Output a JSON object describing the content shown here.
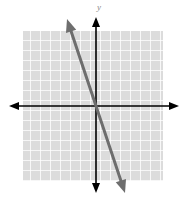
{
  "figure": {
    "title": "",
    "y_axis_label": "y",
    "x_axis_label": "",
    "background_color": "#ffffff"
  },
  "grid": {
    "background_color": "#dcdcdc",
    "line_color": "#ffffff",
    "cell_size_px": 10,
    "left_px": 23,
    "top_px": 31,
    "width_px": 140,
    "height_px": 150,
    "columns": 14,
    "rows": 15
  },
  "axes": {
    "color": "#000000",
    "origin_px": {
      "x": 96,
      "y": 106
    },
    "x_axis": {
      "start_px": 10,
      "end_px": 178,
      "y_px": 106,
      "arrows": "both"
    },
    "y_axis": {
      "start_px": 18,
      "end_px": 192,
      "x_px": 96,
      "arrows": "both"
    }
  },
  "chart_data": {
    "type": "line",
    "title": "",
    "xlabel": "",
    "ylabel": "y",
    "grid": true,
    "legend": null,
    "xlim": [
      -7.3,
      6.7
    ],
    "ylim": [
      -8.6,
      7.5
    ],
    "series": [
      {
        "name": "line",
        "color": "#6e6e6e",
        "stroke_width_px": 3,
        "arrows": "both",
        "slope": -3,
        "y_intercept": 0,
        "equation": "y = -3x",
        "x": [
          -2.9,
          2.9
        ],
        "values": [
          8.7,
          -8.7
        ],
        "endpoints_px": [
          {
            "x": 67,
            "y": 19
          },
          {
            "x": 125,
            "y": 193
          }
        ],
        "points": [
          {
            "x": -2.9,
            "y": 8.7
          },
          {
            "x": 0,
            "y": 0
          },
          {
            "x": 2.9,
            "y": -8.7
          }
        ]
      }
    ]
  }
}
